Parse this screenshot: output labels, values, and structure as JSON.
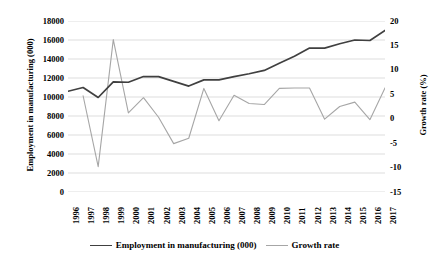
{
  "chart_data": {
    "type": "line",
    "title": "",
    "xlabel": "",
    "categories": [
      "1996",
      "1997",
      "1998",
      "1999",
      "2000",
      "2001",
      "2002",
      "2003",
      "2004",
      "2005",
      "2006",
      "2007",
      "2008",
      "2009",
      "2010",
      "2011",
      "2012",
      "2013",
      "2014",
      "2015",
      "2016",
      "2017"
    ],
    "grid": true,
    "legend_position": "bottom",
    "series": [
      {
        "name": "Employment in manufacturing (000)",
        "axis": "left",
        "color": "#404040",
        "values": [
          10600,
          11000,
          9950,
          11600,
          11550,
          12150,
          12150,
          11650,
          11150,
          11800,
          11800,
          12150,
          12450,
          12800,
          13550,
          14300,
          15150,
          15150,
          15600,
          16000,
          15950,
          17000
        ]
      },
      {
        "name": "Growth rate",
        "axis": "right",
        "color": "#a6a6a6",
        "values": [
          null,
          4.7,
          -9.8,
          16.2,
          1.2,
          4.3,
          0.3,
          -5.1,
          -4.0,
          6.2,
          -0.4,
          4.8,
          3.1,
          2.9,
          6.2,
          6.3,
          6.3,
          -0.1,
          2.5,
          3.4,
          -0.2,
          6.3
        ]
      }
    ],
    "axes": {
      "left": {
        "label": "Employment in manufacturing (000)",
        "ticks": [
          18000,
          16000,
          14000,
          12000,
          10000,
          8000,
          6000,
          4000,
          2000,
          0
        ],
        "min": 0,
        "max": 18000
      },
      "right": {
        "label": "Growth rate (%)",
        "ticks": [
          20,
          15,
          10,
          5,
          0,
          -5,
          -10,
          -15
        ],
        "min": -15,
        "max": 20
      }
    }
  },
  "legend": {
    "entries": [
      {
        "label": "Employment in manufacturing (000)",
        "color": "#404040"
      },
      {
        "label": "Growth rate",
        "color": "#a6a6a6"
      }
    ]
  },
  "colors": {
    "employment_line": "#404040",
    "growth_line": "#a6a6a6",
    "gridline": "#d9d9d9",
    "background": "#ffffff",
    "text": "#000000"
  }
}
